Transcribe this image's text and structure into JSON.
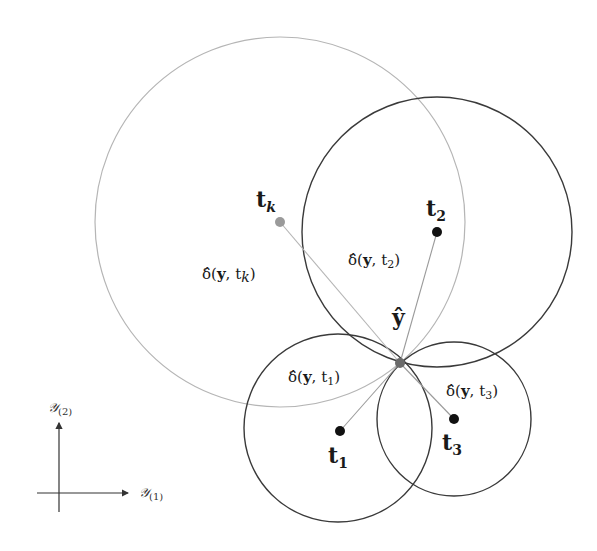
{
  "diagram": {
    "points": {
      "tk": {
        "label": "t",
        "sub": "k"
      },
      "t2": {
        "label": "t",
        "sub": "2"
      },
      "t1": {
        "label": "t",
        "sub": "1"
      },
      "t3": {
        "label": "t",
        "sub": "3"
      },
      "yhat": {
        "label": "ŷ"
      }
    },
    "distances": {
      "tk": {
        "prefix": "δ̂(",
        "y": "y",
        "sep": ", t",
        "sub": "k",
        "close": ")"
      },
      "t2": {
        "prefix": "δ̂(",
        "y": "y",
        "sep": ", t",
        "sub": "2",
        "close": ")"
      },
      "t1": {
        "prefix": "δ̂(",
        "y": "y",
        "sep": ", t",
        "sub": "1",
        "close": ")"
      },
      "t3": {
        "prefix": "δ̂(",
        "y": "y",
        "sep": ", t",
        "sub": "3",
        "close": ")"
      }
    },
    "axes": {
      "x": {
        "label": "𝒴",
        "sub": "(1)"
      },
      "y": {
        "label": "𝒴",
        "sub": "(2)"
      }
    },
    "colors": {
      "dark": "#3a3a3a",
      "grey": "#b5b5b5",
      "tk_dot": "#9a9a9a",
      "yhat_dot": "#6a6a6a",
      "point_dot": "#111111"
    }
  }
}
